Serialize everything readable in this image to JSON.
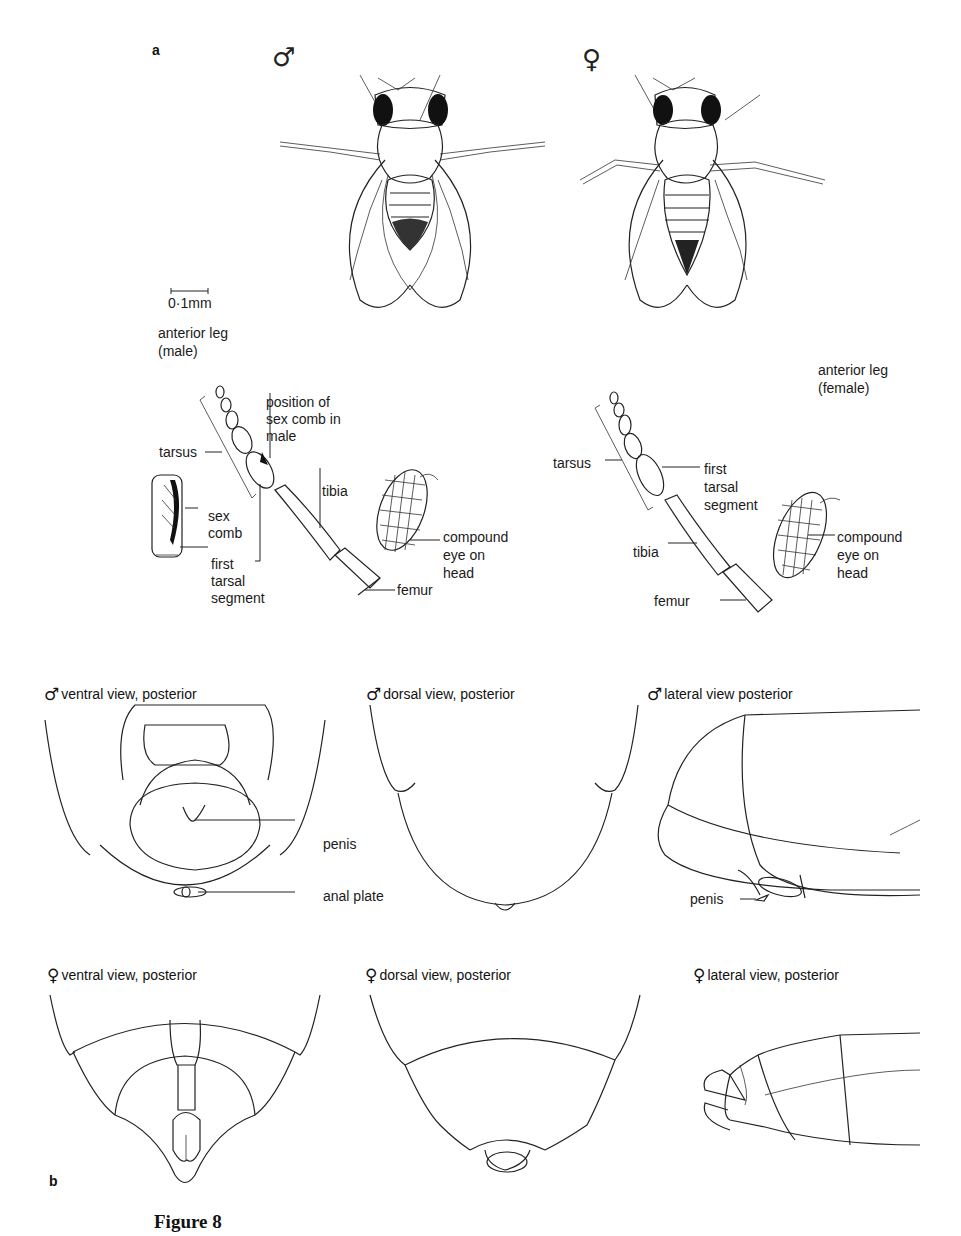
{
  "panel_a": {
    "letter": "a",
    "male_symbol": "♂",
    "female_symbol": "♀",
    "scale_bar": "0·1mm",
    "male_leg_title": [
      "anterior leg",
      "(male)"
    ],
    "female_leg_title": [
      "anterior leg",
      "(female)"
    ],
    "male_leg_labels": {
      "tarsus": "tarsus",
      "sex_comb_position": [
        "position of",
        "sex comb in",
        "male"
      ],
      "tibia": "tibia",
      "sex_comb": [
        "sex",
        "comb"
      ],
      "first_tarsal_segment": [
        "first",
        "tarsal",
        "segment"
      ],
      "compound_eye": [
        "compound",
        "eye on",
        "head"
      ],
      "femur": "femur"
    },
    "female_leg_labels": {
      "tarsus": "tarsus",
      "first_tarsal_segment": [
        "first",
        "tarsal",
        "segment"
      ],
      "tibia": "tibia",
      "compound_eye": [
        "compound",
        "eye on",
        "head"
      ],
      "femur": "femur"
    }
  },
  "panel_b": {
    "letter": "b",
    "male_views": [
      {
        "symbol": "♂",
        "title": "ventral view, posterior",
        "labels": [
          "penis",
          "anal  plate"
        ]
      },
      {
        "symbol": "♂",
        "title": "dorsal view, posterior",
        "labels": []
      },
      {
        "symbol": "♂",
        "title": "lateral view posterior",
        "labels": [
          "penis"
        ]
      }
    ],
    "female_views": [
      {
        "symbol": "♀",
        "title": "ventral view, posterior"
      },
      {
        "symbol": "♀",
        "title": "dorsal view, posterior"
      },
      {
        "symbol": "♀",
        "title": "lateral view, posterior"
      }
    ]
  },
  "caption": "Figure 8"
}
